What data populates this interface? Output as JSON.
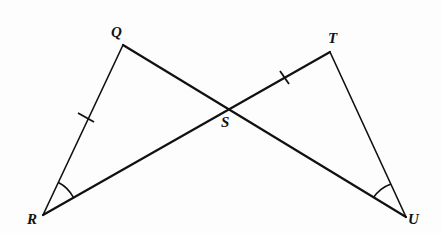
{
  "diagram": {
    "type": "geometry",
    "colors": {
      "stroke": "#111111",
      "background": "#fdfdfd"
    },
    "points": {
      "Q": {
        "label": "Q",
        "x": 123,
        "y": 45
      },
      "T": {
        "label": "T",
        "x": 330,
        "y": 52
      },
      "R": {
        "label": "R",
        "x": 43,
        "y": 215
      },
      "U": {
        "label": "U",
        "x": 406,
        "y": 217
      },
      "S": {
        "label": "S",
        "x": 228,
        "y": 108
      }
    },
    "segments": [
      {
        "name": "QR",
        "from": "Q",
        "to": "R",
        "tick_marks": 1
      },
      {
        "name": "QU",
        "from": "Q",
        "to": "U",
        "tick_marks": 0
      },
      {
        "name": "RT",
        "from": "R",
        "to": "T",
        "tick_marks": 0
      },
      {
        "name": "TU",
        "from": "T",
        "to": "U",
        "tick_marks": 0
      },
      {
        "name": "ST",
        "from": "S",
        "to": "T",
        "tick_marks": 1
      }
    ],
    "congruent_sides": [
      "QR",
      "ST"
    ],
    "congruent_angles": [
      "angle QRS",
      "angle TUS"
    ],
    "angle_marks": [
      {
        "vertex": "R",
        "arcs": 1
      },
      {
        "vertex": "U",
        "arcs": 1
      }
    ]
  }
}
